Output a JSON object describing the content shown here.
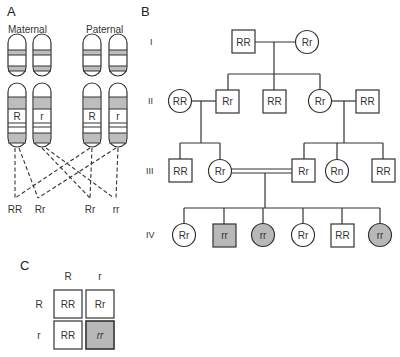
{
  "panels": {
    "a": {
      "label": "A",
      "maternal_label": "Maternal",
      "paternal_label": "Paternal",
      "chromosomes": [
        {
          "group": "maternal",
          "allele": "R"
        },
        {
          "group": "maternal",
          "allele": "r"
        },
        {
          "group": "paternal",
          "allele": "R"
        },
        {
          "group": "paternal",
          "allele": "r"
        }
      ],
      "offspring_genotypes": [
        "RR",
        "Rr",
        "Rr",
        "rr"
      ]
    },
    "b": {
      "label": "B",
      "generations": [
        "I",
        "II",
        "III",
        "IV"
      ],
      "individuals": {
        "I": [
          {
            "sex": "male",
            "genotype": "RR",
            "affected": false
          },
          {
            "sex": "female",
            "genotype": "Rr",
            "affected": false
          }
        ],
        "II": [
          {
            "sex": "female",
            "genotype": "RR",
            "affected": false
          },
          {
            "sex": "male",
            "genotype": "Rr",
            "affected": false
          },
          {
            "sex": "male",
            "genotype": "RR",
            "affected": false
          },
          {
            "sex": "female",
            "genotype": "Rr",
            "affected": false
          },
          {
            "sex": "male",
            "genotype": "RR",
            "affected": false
          }
        ],
        "III": [
          {
            "sex": "male",
            "genotype": "RR",
            "affected": false
          },
          {
            "sex": "female",
            "genotype": "Rr",
            "affected": false
          },
          {
            "sex": "male",
            "genotype": "Rr",
            "affected": false
          },
          {
            "sex": "female",
            "genotype": "Rn",
            "affected": false
          },
          {
            "sex": "male",
            "genotype": "RR",
            "affected": false
          }
        ],
        "IV": [
          {
            "sex": "female",
            "genotype": "Rr",
            "affected": false
          },
          {
            "sex": "male",
            "genotype": "rr",
            "affected": true
          },
          {
            "sex": "female",
            "genotype": "rr",
            "affected": true
          },
          {
            "sex": "female",
            "genotype": "Rr",
            "affected": false
          },
          {
            "sex": "male",
            "genotype": "RR",
            "affected": false
          },
          {
            "sex": "female",
            "genotype": "rr",
            "affected": true
          }
        ]
      }
    },
    "c": {
      "label": "C",
      "col_headers": [
        "R",
        "r"
      ],
      "row_headers": [
        "R",
        "r"
      ],
      "cells": [
        [
          "RR",
          "Rr"
        ],
        [
          "RR",
          "rr"
        ]
      ],
      "shaded_cell": "rr"
    }
  },
  "colors": {
    "affected_fill": "#b8b8b8",
    "band_fill": "#bdbdbd",
    "stroke": "#333333"
  }
}
